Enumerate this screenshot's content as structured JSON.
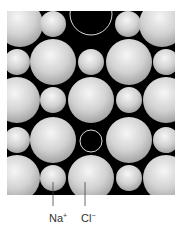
{
  "diagram": {
    "panel": {
      "x": 7,
      "y": 11,
      "width": 168,
      "height": 184,
      "background": "#000000"
    },
    "colors": {
      "sphere_light": "#f4f4f4",
      "sphere_mid": "#c8c8c8",
      "sphere_dark": "#9a9a9a",
      "vacancy_ring": "#d8d8d8",
      "leader_line": "#444444",
      "label_text": "#333333"
    },
    "ions": {
      "large_radius": 23,
      "small_radius": 13,
      "rows": [
        {
          "y": 24,
          "items": [
            {
              "x": 20,
              "type": "Cl"
            },
            {
              "x": 53,
              "type": "Na"
            },
            {
              "x": 91,
              "type": "vacancy-large"
            },
            {
              "x": 128,
              "type": "Na"
            },
            {
              "x": 162,
              "type": "Cl"
            }
          ]
        },
        {
          "y": 62,
          "items": [
            {
              "x": 17,
              "type": "Na"
            },
            {
              "x": 53,
              "type": "Cl"
            },
            {
              "x": 91,
              "type": "Na"
            },
            {
              "x": 129,
              "type": "Cl"
            },
            {
              "x": 166,
              "type": "Na"
            }
          ]
        },
        {
          "y": 100,
          "items": [
            {
              "x": 17,
              "type": "Cl"
            },
            {
              "x": 53,
              "type": "Na"
            },
            {
              "x": 91,
              "type": "Cl"
            },
            {
              "x": 129,
              "type": "Na"
            },
            {
              "x": 166,
              "type": "Cl"
            }
          ]
        },
        {
          "y": 140,
          "items": [
            {
              "x": 17,
              "type": "Na"
            },
            {
              "x": 53,
              "type": "Cl"
            },
            {
              "x": 91,
              "type": "vacancy-small"
            },
            {
              "x": 129,
              "type": "Cl"
            },
            {
              "x": 166,
              "type": "Na"
            }
          ]
        },
        {
          "y": 178,
          "items": [
            {
              "x": 17,
              "type": "Cl"
            },
            {
              "x": 53,
              "type": "Na"
            },
            {
              "x": 91,
              "type": "Cl"
            },
            {
              "x": 129,
              "type": "Na"
            },
            {
              "x": 166,
              "type": "Cl"
            }
          ]
        }
      ]
    },
    "labels": [
      {
        "id": "na",
        "base": "Na",
        "charge": "+",
        "line_x": 53,
        "text_x": 49
      },
      {
        "id": "cl",
        "base": "Cl",
        "charge": "−",
        "line_x": 85,
        "text_x": 81
      }
    ]
  }
}
